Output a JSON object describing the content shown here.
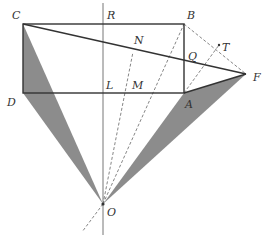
{
  "diagram": {
    "type": "geometry-construction",
    "colors": {
      "stroke": "#333333",
      "thin": "#666666",
      "dashed": "#777777",
      "shade": "#8c8c8c"
    },
    "points": {
      "C": {
        "label": "C",
        "x": 23,
        "y": 24
      },
      "R": {
        "label": "R",
        "x": 103,
        "y": 24
      },
      "B": {
        "label": "B",
        "x": 184,
        "y": 24
      },
      "N": {
        "label": "N",
        "x": 133,
        "y": 52
      },
      "Q": {
        "label": "Q",
        "x": 184,
        "y": 66
      },
      "T": {
        "label": "T",
        "x": 219,
        "y": 45
      },
      "F": {
        "label": "F",
        "x": 246,
        "y": 74
      },
      "D": {
        "label": "D",
        "x": 23,
        "y": 93
      },
      "L": {
        "label": "L",
        "x": 103,
        "y": 93
      },
      "M": {
        "label": "M",
        "x": 125,
        "y": 93
      },
      "A": {
        "label": "A",
        "x": 184,
        "y": 93
      },
      "O": {
        "label": "O",
        "x": 103,
        "y": 204
      }
    },
    "segments_solid": [
      "CB",
      "BA",
      "AD",
      "DC",
      "CF",
      "AF"
    ],
    "segments_dashed": [
      "BF",
      "AT",
      "OB",
      "ON",
      "FO-extension"
    ],
    "axis_line": "vertical line through R, L, O",
    "shaded_triangles": [
      "CDO",
      "AFO"
    ]
  }
}
